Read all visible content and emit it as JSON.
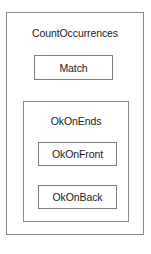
{
  "diagram": {
    "type": "nested-state-diagram",
    "background_color": "#ffffff",
    "border_color": "#8a8a8a",
    "text_color": "#1a1a1a",
    "outer_state": {
      "label": "CountOccurrences",
      "children": [
        {
          "label": "Match",
          "kind": "simple-state"
        },
        {
          "label": "OkOnEnds",
          "kind": "composite-state",
          "children": [
            {
              "label": "OkOnFront",
              "kind": "simple-state"
            },
            {
              "label": "OkOnBack",
              "kind": "simple-state"
            }
          ]
        }
      ]
    }
  }
}
